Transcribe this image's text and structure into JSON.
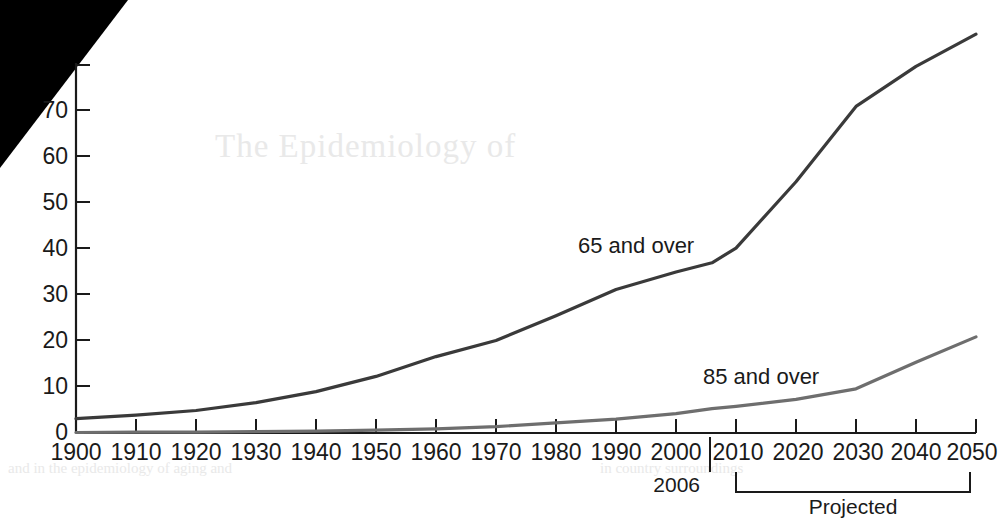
{
  "chart_data": {
    "type": "line",
    "title": "",
    "xlabel": "",
    "ylabel": "",
    "x": [
      1900,
      1910,
      1920,
      1930,
      1940,
      1950,
      1960,
      1970,
      1980,
      1990,
      2000,
      2006,
      2010,
      2020,
      2030,
      2040,
      2050
    ],
    "xlim": [
      1900,
      2050
    ],
    "ylim": [
      0,
      80
    ],
    "grid": false,
    "legend_position": "inline-annotation",
    "y_ticks": [
      0,
      10,
      20,
      30,
      40,
      50,
      60,
      70,
      80
    ],
    "y_tick_labels": [
      "0",
      "10",
      "20",
      "30",
      "40",
      "50",
      "60",
      "70",
      ""
    ],
    "x_tick_labels": [
      "1900",
      "1910",
      "1920",
      "1930",
      "1940",
      "1950",
      "1960",
      "1970",
      "1980",
      "1990",
      "2000",
      "2010",
      "2020",
      "2030",
      "2040",
      "2050"
    ],
    "series": [
      {
        "name": "65 and over",
        "color": "#3a3a3a",
        "values": [
          3.1,
          3.9,
          4.9,
          6.6,
          9.0,
          12.3,
          16.6,
          20.1,
          25.5,
          31.2,
          35.0,
          37.0,
          40.2,
          54.6,
          71.0,
          79.7,
          86.7
        ]
      },
      {
        "name": "85 and over",
        "color": "#6e6e6e",
        "values": [
          0.1,
          0.2,
          0.2,
          0.3,
          0.4,
          0.6,
          0.9,
          1.4,
          2.2,
          3.0,
          4.2,
          5.3,
          5.8,
          7.3,
          9.6,
          15.4,
          20.9
        ]
      }
    ],
    "annotations": [
      {
        "name": "series-label-65",
        "text": "65 and over",
        "x": 2000,
        "y": 44
      },
      {
        "name": "series-label-85",
        "text": "85 and over",
        "x": 2022,
        "y": 13
      },
      {
        "name": "reference-year",
        "text": "2006",
        "x": 2006,
        "y": 0
      },
      {
        "name": "projection-bracket",
        "text": "Projected",
        "from": 2006,
        "to": 2050
      }
    ]
  },
  "axis": {
    "y_labels": [
      "70",
      "60",
      "50",
      "40",
      "30",
      "20",
      "10",
      "0"
    ],
    "x_labels": [
      "1900",
      "1910",
      "1920",
      "1930",
      "1940",
      "1950",
      "1960",
      "1970",
      "1980",
      "1990",
      "2000",
      "2010",
      "2020",
      "2030",
      "2040",
      "2050"
    ]
  },
  "labels": {
    "series_65": "65 and over",
    "series_85": "85 and over",
    "reference_year": "2006",
    "projected": "Projected"
  },
  "background_showthrough": {
    "line_a": "The Epidemiology of",
    "line_b": "and in the epidemiology of aging and",
    "line_c": "in country surroundings"
  },
  "colors": {
    "series_65": "#3a3a3a",
    "series_85": "#6e6e6e",
    "axis": "#1a1a1a",
    "page": "#ffffff"
  }
}
